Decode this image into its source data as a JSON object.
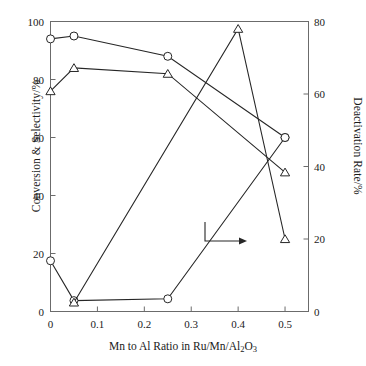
{
  "chart_data": {
    "type": "line",
    "title": "",
    "xlabel": "Mn to Al Ratio in Ru/Mn/Al2O3",
    "xlabel_html": "Mn to Al Ratio in Ru/Mn/Al<sub>2</sub>O<sub>3</sub>",
    "ylabel": "Conversion & Selectivity/%",
    "ylabel_right": "Deactivation Rate/%",
    "xlim": [
      0,
      0.55
    ],
    "ylim": [
      0,
      100
    ],
    "ylim_right": [
      0,
      80
    ],
    "xticks": [
      0,
      0.1,
      0.2,
      0.3,
      0.4,
      0.5
    ],
    "xtick_labels": [
      "0",
      "0.1",
      "0.2",
      "0.3",
      "0.4",
      "0.5"
    ],
    "yticks": [
      0,
      20,
      40,
      60,
      80,
      100
    ],
    "ytick_labels": [
      "0",
      "20",
      "40",
      "60",
      "80",
      "100"
    ],
    "yticks_right": [
      0,
      20,
      40,
      60,
      80
    ],
    "ytick_labels_right": [
      "0",
      "20",
      "40",
      "60",
      "80"
    ],
    "grid": false,
    "legend": "none",
    "frame": true,
    "x": [
      0,
      0.05,
      0.25,
      0.5
    ],
    "series": [
      {
        "name": "Conversion",
        "axis": "left",
        "marker": "circle",
        "values": [
          94,
          95,
          88,
          60
        ]
      },
      {
        "name": "Selectivity",
        "axis": "left",
        "marker": "triangle",
        "values": [
          76,
          84,
          82,
          48
        ]
      },
      {
        "name": "Deactivation Rate (circle)",
        "axis": "right",
        "marker": "circle",
        "values": [
          14,
          3,
          3.5,
          48
        ]
      },
      {
        "name": "Deactivation Rate (triangle)",
        "axis": "right",
        "marker": "triangle",
        "x": [
          0.05,
          0.4,
          0.5
        ],
        "values": [
          2.5,
          78,
          20
        ]
      }
    ],
    "annotations": [
      {
        "type": "arrow",
        "label": "",
        "direction": "right",
        "description": "elbow arrow pointing to right-hand axis"
      }
    ],
    "colors": {
      "line": "#262626",
      "marker_fill": "#ffffff",
      "axis": "#6b6b6b",
      "text": "#1a1a1a"
    }
  }
}
